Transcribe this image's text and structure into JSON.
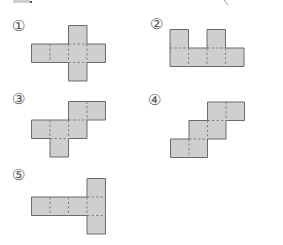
{
  "figure": {
    "colors": {
      "fill": "#cfcfcf",
      "border": "#6b6b6b",
      "fold_line": "#7a7a7a",
      "label": "#555555"
    },
    "square_size": 18.5,
    "nets": [
      {
        "label": "①",
        "label_pos": [
          12,
          20
        ],
        "origin": [
          31.5,
          25.5
        ],
        "cells": [
          [
            2,
            0
          ],
          [
            0,
            1
          ],
          [
            1,
            1
          ],
          [
            2,
            1
          ],
          [
            3,
            1
          ],
          [
            2,
            2
          ]
        ]
      },
      {
        "label": "②",
        "label_pos": [
          150,
          18
        ],
        "origin": [
          170,
          29.5
        ],
        "cells": [
          [
            0,
            0
          ],
          [
            2,
            0
          ],
          [
            0,
            1
          ],
          [
            1,
            1
          ],
          [
            2,
            1
          ],
          [
            3,
            1
          ]
        ]
      },
      {
        "label": "③",
        "label_pos": [
          12,
          93
        ],
        "origin": [
          31.5,
          101.5
        ],
        "cells": [
          [
            2,
            0
          ],
          [
            3,
            0
          ],
          [
            0,
            1
          ],
          [
            1,
            1
          ],
          [
            2,
            1
          ],
          [
            1,
            2
          ]
        ]
      },
      {
        "label": "④",
        "label_pos": [
          148,
          94
        ],
        "origin": [
          170.5,
          102
        ],
        "cells": [
          [
            2,
            0
          ],
          [
            3,
            0
          ],
          [
            1,
            1
          ],
          [
            2,
            1
          ],
          [
            0,
            2
          ],
          [
            1,
            2
          ]
        ]
      },
      {
        "label": "⑤",
        "label_pos": [
          12,
          169
        ],
        "origin": [
          31.5,
          178.5
        ],
        "cells": [
          [
            3,
            0
          ],
          [
            0,
            1
          ],
          [
            1,
            1
          ],
          [
            2,
            1
          ],
          [
            3,
            1
          ],
          [
            3,
            2
          ]
        ]
      }
    ]
  }
}
